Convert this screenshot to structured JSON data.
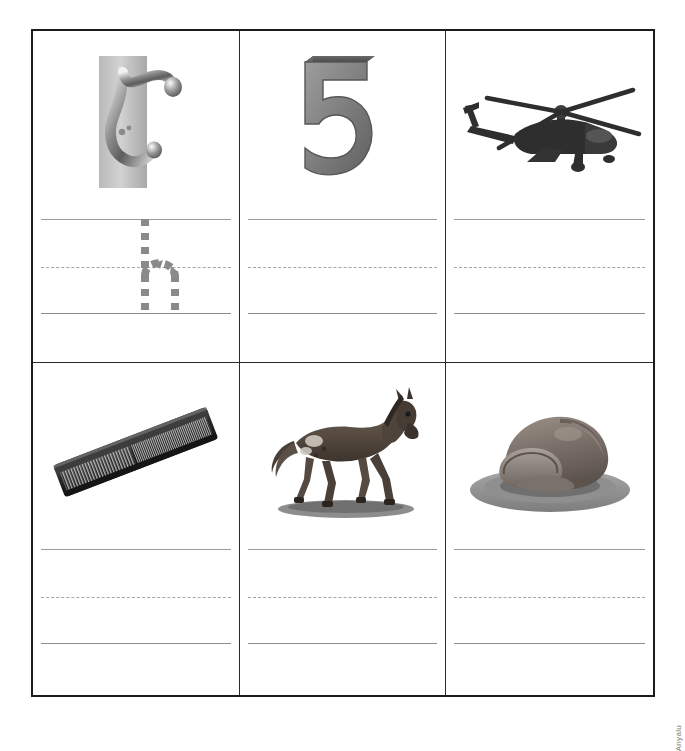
{
  "worksheet": {
    "title": "Handwriting practice worksheet - letter h",
    "columns": 3,
    "rows": 2,
    "border_color": "#1c1c1c",
    "rule_color": "#9a9a9a",
    "trace_color": "#8a8a8a"
  },
  "watermark": {
    "text": "Anyalu"
  },
  "cells": [
    {
      "index": 1,
      "picture_name": "coat-hook",
      "picture_caption": "hook",
      "has_trace_letter": true,
      "trace_letter": "h",
      "lines": {
        "top": "solid",
        "middle": "dashed",
        "bottom": "solid"
      }
    },
    {
      "index": 2,
      "picture_name": "house-number-five",
      "picture_caption": "house number 5",
      "has_trace_letter": false,
      "trace_letter": "",
      "lines": {
        "top": "solid",
        "middle": "dashed",
        "bottom": "solid"
      }
    },
    {
      "index": 3,
      "picture_name": "helicopter",
      "picture_caption": "helicopter",
      "has_trace_letter": false,
      "trace_letter": "",
      "lines": {
        "top": "solid",
        "middle": "dashed",
        "bottom": "solid"
      }
    },
    {
      "index": 4,
      "picture_name": "hair-comb",
      "picture_caption": "comb",
      "has_trace_letter": false,
      "trace_letter": "",
      "lines": {
        "top": "solid",
        "middle": "dashed",
        "bottom": "solid"
      }
    },
    {
      "index": 5,
      "picture_name": "horse",
      "picture_caption": "horse",
      "has_trace_letter": false,
      "trace_letter": "",
      "lines": {
        "top": "solid",
        "middle": "dashed",
        "bottom": "solid"
      }
    },
    {
      "index": 6,
      "picture_name": "ham",
      "picture_caption": "ham",
      "has_trace_letter": false,
      "trace_letter": "",
      "lines": {
        "top": "solid",
        "middle": "dashed",
        "bottom": "solid"
      }
    }
  ]
}
